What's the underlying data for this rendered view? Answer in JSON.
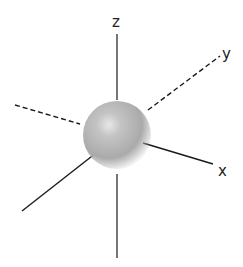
{
  "diagram": {
    "axes": {
      "z": {
        "label": "z"
      },
      "y": {
        "label": "y"
      },
      "x": {
        "label": "x"
      }
    },
    "colors": {
      "axis": "#1a1a1a",
      "sphere_light": "#e0e0e0",
      "sphere_mid": "#b4b4b4",
      "sphere_edge": "#9a9a9a"
    }
  }
}
